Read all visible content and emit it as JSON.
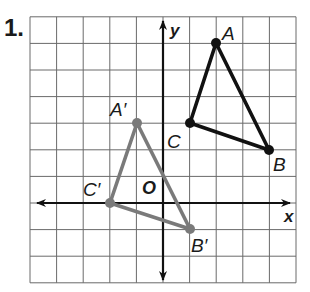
{
  "problem": {
    "number": "1."
  },
  "grid": {
    "x_min": -5,
    "x_max": 5,
    "y_min": -3,
    "y_max": 7,
    "origin_px": [
      163,
      203
    ],
    "cell_px": 26.6,
    "line_color": "#555555"
  },
  "axes": {
    "x_label": "x",
    "y_label": "y",
    "origin_label": "O",
    "color": "#111111"
  },
  "figures": [
    {
      "name": "triangle-ABC",
      "color": "#111111",
      "vertices": [
        {
          "label": "A",
          "x": 2,
          "y": 6
        },
        {
          "label": "B",
          "x": 4,
          "y": 2
        },
        {
          "label": "C",
          "x": 1,
          "y": 3
        }
      ]
    },
    {
      "name": "triangle-A'B'C'",
      "color": "#777777",
      "vertices": [
        {
          "label": "A′",
          "x": -1,
          "y": 3
        },
        {
          "label": "B′",
          "x": 1,
          "y": -1
        },
        {
          "label": "C′",
          "x": -2,
          "y": 0
        }
      ]
    }
  ],
  "labels": {
    "A": "A",
    "B": "B",
    "C": "C",
    "A_prime": "A′",
    "B_prime": "B′",
    "C_prime": "C′"
  }
}
